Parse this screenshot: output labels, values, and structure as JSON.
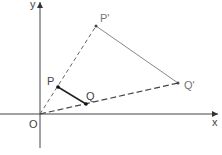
{
  "diagram": {
    "axes": {
      "x_label": "x",
      "y_label": "y",
      "origin_label": "O"
    },
    "points": {
      "P": {
        "label": "P",
        "x": 58,
        "y": 87
      },
      "Q": {
        "label": "Q",
        "x": 86,
        "y": 104
      },
      "P_prime": {
        "label": "P'",
        "x": 96,
        "y": 26
      },
      "Q_prime": {
        "label": "Q'",
        "x": 178,
        "y": 83
      },
      "O": {
        "label": "O",
        "x": 40,
        "y": 114
      }
    },
    "colors": {
      "axis": "#333333",
      "segment_PQ": "#222222",
      "segment_PprimeQprime": "#888888",
      "dashed": "#555555",
      "point": "#111111"
    }
  }
}
